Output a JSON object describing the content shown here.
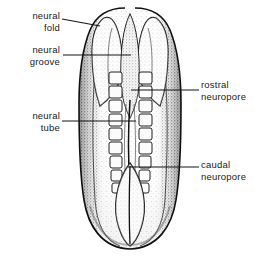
{
  "figure": {
    "background_color": "#ffffff",
    "ink_color": "#111111",
    "labels": [
      {
        "id": "neural-fold",
        "text": "neural\nfold",
        "side": "left",
        "x": 4,
        "y": 10,
        "width": 56
      },
      {
        "id": "neural-groove",
        "text": "neural\ngroove",
        "side": "left",
        "x": 2,
        "y": 44,
        "width": 58
      },
      {
        "id": "neural-tube",
        "text": "neural\ntube",
        "side": "left",
        "x": 4,
        "y": 110,
        "width": 56
      },
      {
        "id": "rostral-neuropore",
        "text": "rostral\nneuropore",
        "side": "right",
        "x": 201,
        "y": 79,
        "width": 60
      },
      {
        "id": "caudal-neuropore",
        "text": "caudal\nneuropore",
        "side": "right",
        "x": 201,
        "y": 159,
        "width": 60
      }
    ],
    "leaders": [
      {
        "id": "leader-neural-fold",
        "points": "62,19 100,26"
      },
      {
        "id": "leader-neural-groove",
        "points": "63,55 131,55"
      },
      {
        "id": "leader-neural-tube",
        "points": "62,121 136,121"
      },
      {
        "id": "leader-rostral-neuropore",
        "points": "199,90 131,90"
      },
      {
        "id": "leader-caudal-neuropore",
        "points": "199,167 128,167"
      }
    ],
    "structures": [
      {
        "id": "neural-fold-left",
        "name": "left neural fold"
      },
      {
        "id": "neural-fold-right",
        "name": "right neural fold"
      },
      {
        "id": "neural-groove",
        "name": "neural groove (midline)"
      },
      {
        "id": "somites",
        "name": "somite blocks",
        "count_per_side": 9
      },
      {
        "id": "rostral-neuropore",
        "name": "rostral neuropore opening"
      },
      {
        "id": "caudal-neuropore",
        "name": "caudal neuropore opening"
      },
      {
        "id": "embryo-body",
        "name": "embryo body outline"
      }
    ]
  }
}
